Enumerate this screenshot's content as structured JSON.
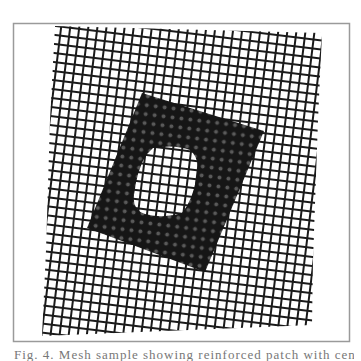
{
  "figure": {
    "frame": {
      "x": 13,
      "y": 23,
      "width": 337,
      "height": 319,
      "stroke": "#9a9a9a"
    },
    "mesh": {
      "description": "woven wire mesh grid (rotated)",
      "line_color": "#1a1a1a",
      "spacing": 9,
      "rotation_deg": 7,
      "outline": [
        [
          55,
          26
        ],
        [
          322,
          33
        ],
        [
          313,
          260
        ],
        [
          312,
          325
        ],
        [
          42,
          336
        ],
        [
          47,
          200
        ]
      ]
    },
    "dark_region": {
      "description": "dark square patch on mesh",
      "color": "#1c1c1c",
      "corners": [
        [
          142,
          93
        ],
        [
          264,
          131
        ],
        [
          205,
          272
        ],
        [
          87,
          228
        ]
      ]
    },
    "hole": {
      "description": "white opening inside dark patch",
      "bbox": [
        133,
        147,
        198,
        216
      ]
    }
  },
  "caption": {
    "text": "Fig. 4. Mesh sample showing reinforced patch with central aperture"
  }
}
